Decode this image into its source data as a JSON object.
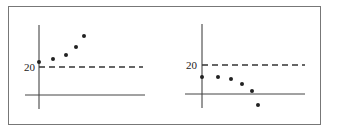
{
  "chart_data": [
    {
      "type": "scatter",
      "title": "",
      "xlabel": "",
      "ylabel": "",
      "reference_line": {
        "y": 20,
        "label": "20",
        "style": "dashed"
      },
      "points_pixel": [
        [
          39,
          62
        ],
        [
          53,
          59
        ],
        [
          66,
          55
        ],
        [
          76,
          47
        ],
        [
          84,
          36
        ]
      ],
      "trend": "increasing, all points above 20",
      "grid": false
    },
    {
      "type": "scatter",
      "title": "",
      "xlabel": "",
      "ylabel": "",
      "reference_line": {
        "y": 20,
        "label": "20",
        "style": "dashed"
      },
      "points_pixel": [
        [
          202,
          77
        ],
        [
          218,
          77
        ],
        [
          231,
          79
        ],
        [
          242,
          84
        ],
        [
          252,
          91
        ],
        [
          258,
          105
        ]
      ],
      "trend": "decreasing, all points below 20",
      "grid": false
    }
  ],
  "labels": {
    "left_ref": "20",
    "right_ref": "20"
  },
  "colors": {
    "ink": "#222222",
    "frame": "#777777",
    "background": "#ffffff"
  }
}
